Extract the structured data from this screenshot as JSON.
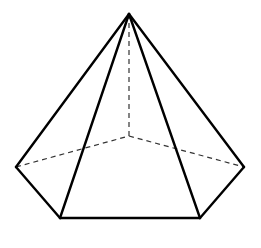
{
  "diagram": {
    "type": "pentagonal-pyramid",
    "colors": {
      "edge": "#000000",
      "hidden_edge": "#333333",
      "background": "#ffffff"
    },
    "vertices": {
      "apex": [
        129,
        14
      ],
      "left": [
        16,
        167
      ],
      "front_left": [
        60,
        218
      ],
      "front_right": [
        200,
        218
      ],
      "right": [
        244,
        167
      ],
      "back": [
        129,
        136
      ]
    },
    "visible_edges": [
      [
        "apex",
        "left"
      ],
      [
        "apex",
        "front_left"
      ],
      [
        "apex",
        "front_right"
      ],
      [
        "apex",
        "right"
      ],
      [
        "left",
        "front_left"
      ],
      [
        "front_left",
        "front_right"
      ],
      [
        "front_right",
        "right"
      ]
    ],
    "hidden_edges": [
      [
        "apex",
        "back"
      ],
      [
        "left",
        "back"
      ],
      [
        "back",
        "right"
      ]
    ]
  }
}
